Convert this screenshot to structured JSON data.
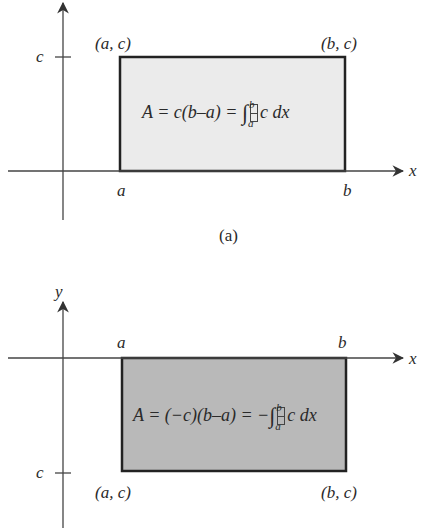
{
  "figure_a": {
    "caption": "(a)",
    "y_tick_label": "c",
    "x_axis_label": "x",
    "corner_top_left": "(a, c)",
    "corner_top_right": "(b, c)",
    "x_tick_a": "a",
    "x_tick_b": "b",
    "formula": {
      "lhs": "A = c(b–a) = ",
      "integral": "∫",
      "upper_limit": "b",
      "lower_limit": "a",
      "integrand": "c dx"
    },
    "fill_color": "#ebebeb"
  },
  "figure_b": {
    "y_axis_label": "y",
    "x_axis_label": "x",
    "y_tick_label": "c",
    "x_tick_a": "a",
    "x_tick_b": "b",
    "corner_bottom_left": "(a, c)",
    "corner_bottom_right": "(b, c)",
    "formula": {
      "lhs": "A = (−c)(b–a) = −",
      "integral": "∫",
      "upper_limit": "b",
      "lower_limit": "a",
      "integrand": "c dx"
    },
    "fill_color": "#b9b9b9"
  }
}
